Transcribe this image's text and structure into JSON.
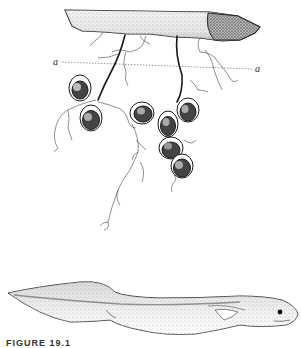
{
  "figure": {
    "labels": {
      "left": "a",
      "right": "a"
    },
    "caption": "FIGURE 19.1",
    "parts": [
      "submerged-stick",
      "egg-stalks",
      "egg-capsules",
      "rootlets",
      "larva"
    ]
  },
  "colors": {
    "ink": "#1a1a1a",
    "stipple": "#555555",
    "background": "#ffffff"
  }
}
